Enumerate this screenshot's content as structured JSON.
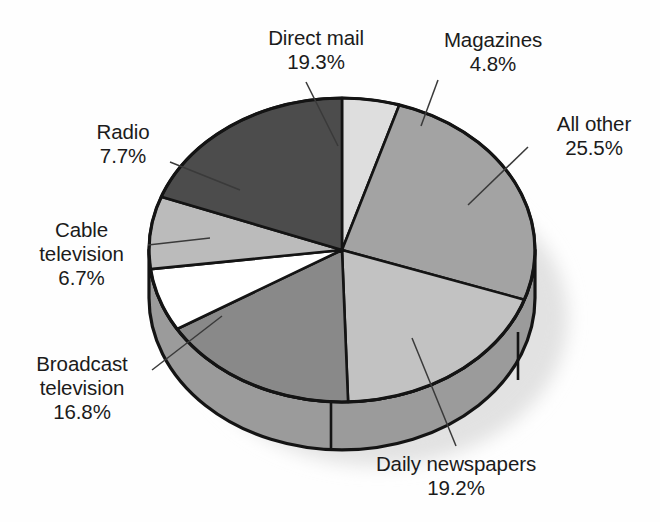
{
  "chart_data": {
    "type": "pie",
    "title": "",
    "subtitle": "",
    "xlabel": "",
    "ylabel": "",
    "three_d": true,
    "legend_position": "none",
    "labels_style": "external-with-leader-lines",
    "units": "percent",
    "total": 100.0,
    "categories": [
      "Magazines",
      "All other",
      "Daily newspapers",
      "Broadcast television",
      "Cable television",
      "Radio",
      "Direct mail"
    ],
    "values": [
      4.8,
      25.5,
      19.2,
      16.8,
      6.7,
      7.7,
      19.3
    ],
    "slices": [
      {
        "name": "Magazines",
        "label": "Magazines",
        "value": 4.8,
        "value_text": "4.8%",
        "color": "#dedede",
        "start_angle_deg": 0.0,
        "end_angle_deg": 17.28
      },
      {
        "name": "All other",
        "label": "All other",
        "value": 25.5,
        "value_text": "25.5%",
        "color": "#a3a3a3",
        "start_angle_deg": 17.28,
        "end_angle_deg": 109.08
      },
      {
        "name": "Daily newspapers",
        "label": "Daily newspapers",
        "value": 19.2,
        "value_text": "19.2%",
        "color": "#c2c2c2",
        "start_angle_deg": 109.08,
        "end_angle_deg": 178.2
      },
      {
        "name": "Broadcast television",
        "label": "Broadcast television",
        "value": 16.8,
        "value_text": "16.8%",
        "color": "#898989",
        "start_angle_deg": 178.2,
        "end_angle_deg": 238.68
      },
      {
        "name": "Cable television",
        "label": "Cable television",
        "value": 6.7,
        "value_text": "6.7%",
        "color": "#ffffff",
        "start_angle_deg": 238.68,
        "end_angle_deg": 262.8
      },
      {
        "name": "Radio",
        "label": "Radio",
        "value": 7.7,
        "value_text": "7.7%",
        "color": "#bbbbbb",
        "start_angle_deg": 262.8,
        "end_angle_deg": 290.52
      },
      {
        "name": "Direct mail",
        "label": "Direct mail",
        "value": 19.3,
        "value_text": "19.3%",
        "color": "#4c4c4c",
        "start_angle_deg": 290.52,
        "end_angle_deg": 360.0
      }
    ]
  },
  "labels": {
    "direct_mail": {
      "name": "Direct mail",
      "pct": "19.3%"
    },
    "magazines": {
      "name": "Magazines",
      "pct": "4.8%"
    },
    "all_other": {
      "name": "All other",
      "pct": "25.5%"
    },
    "radio": {
      "name": "Radio",
      "pct": "7.7%"
    },
    "cable_television": {
      "name": "Cable",
      "name2": "television",
      "pct": "6.7%"
    },
    "broadcast_television": {
      "name": "Broadcast",
      "name2": "television",
      "pct": "16.8%"
    },
    "daily_newspapers": {
      "name": "Daily newspapers",
      "pct": "19.2%"
    }
  },
  "colors": {
    "outline": "#141414",
    "side_wall": "#9b9b9b",
    "shadow": "#e0e0e0",
    "text": "#1b1b1b",
    "background": "#fefefe"
  }
}
